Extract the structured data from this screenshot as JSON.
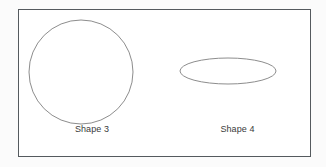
{
  "figure": {
    "background_color": "#fbfbfb",
    "frame": {
      "border_color": "#555a5e",
      "fill_color": "#ffffff"
    },
    "stroke_color": "#8d8d8d",
    "label_color": "#3a3a3a",
    "shapes": [
      {
        "id": "shape-3",
        "label": "Shape 3",
        "kind": "circle",
        "cx": 62,
        "cy": 62,
        "rx": 52,
        "ry": 52
      },
      {
        "id": "shape-4",
        "label": "Shape 4",
        "kind": "ellipse",
        "cx": 63,
        "cy": 61,
        "rx": 48,
        "ry": 13
      }
    ]
  }
}
